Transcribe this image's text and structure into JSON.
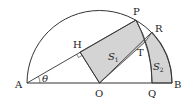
{
  "diagram": {
    "type": "geometry",
    "points": {
      "A": {
        "label": "A",
        "x": 27,
        "y": 83
      },
      "B": {
        "label": "B",
        "x": 172,
        "y": 83
      },
      "O": {
        "label": "O",
        "x": 99.5,
        "y": 83
      },
      "P": {
        "label": "P",
        "x": 136,
        "y": 20
      },
      "R": {
        "label": "R",
        "x": 152,
        "y": 32
      },
      "H": {
        "label": "H",
        "x": 80,
        "y": 52
      },
      "T": {
        "label": "T",
        "x": 145,
        "y": 42
      },
      "Q": {
        "label": "Q",
        "x": 152,
        "y": 83
      }
    },
    "angle_label": "θ",
    "regions": [
      {
        "name": "S1",
        "label": "S",
        "subscript": "1",
        "fill": "#d4d4d4"
      },
      {
        "name": "S2",
        "label": "S",
        "subscript": "2",
        "fill": "#d4d4d4"
      }
    ],
    "colors": {
      "stroke": "#333333",
      "shade": "#d4d4d4",
      "background": "#ffffff"
    }
  }
}
